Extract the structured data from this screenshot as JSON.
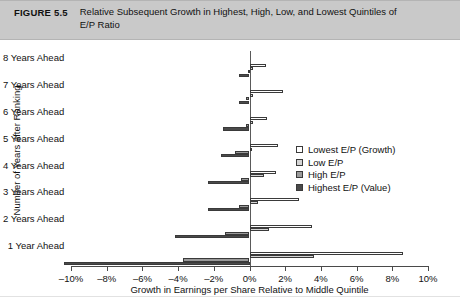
{
  "caption": {
    "figure_number": "FIGURE 5.5",
    "title": "Relative Subsequent Growth in Highest, High, Low, and Lowest Quintiles of E/P Ratio"
  },
  "chart_data": {
    "type": "bar",
    "orientation": "horizontal",
    "title": "Relative Subsequent Growth in Highest, High, Low, and Lowest Quintiles of E/P Ratio",
    "xlabel": "Growth in Earnings per Share Relative to Middle Quintile",
    "ylabel": "Number of Years after Ranking",
    "xlim": [
      -10,
      10
    ],
    "xticks": [
      -10,
      -8,
      -6,
      -4,
      -2,
      0,
      2,
      4,
      6,
      8,
      10
    ],
    "xtick_labels": [
      "–10%",
      "–8%",
      "–6%",
      "–4%",
      "–2%",
      "0%",
      "2%",
      "4%",
      "6%",
      "8%",
      "10%"
    ],
    "grid": false,
    "legend_position": "right",
    "categories": [
      "8 Years Ahead",
      "7 Years Ahead",
      "6 Years Ahead",
      "5 Years Ahead",
      "4 Years Ahead",
      "3 Years Ahead",
      "2 Years Ahead",
      "1 Year Ahead"
    ],
    "series": [
      {
        "name": "Lowest E/P (Growth)",
        "color": "#ffffff",
        "values": [
          0.9,
          1.9,
          1.0,
          1.6,
          1.5,
          2.8,
          3.5,
          8.6
        ]
      },
      {
        "name": "Low E/P",
        "color": "#d5d5d5",
        "values": [
          0.2,
          0.2,
          0.2,
          0.1,
          0.8,
          0.5,
          1.1,
          3.6
        ]
      },
      {
        "name": "High E/P",
        "color": "#9a9a9a",
        "values": [
          -0.1,
          -0.2,
          -0.2,
          -0.8,
          -0.5,
          -0.6,
          -1.4,
          -3.7
        ]
      },
      {
        "name": "Highest E/P (Value)",
        "color": "#4a4a4a",
        "values": [
          -0.6,
          -0.6,
          -1.5,
          -1.6,
          -2.3,
          -2.3,
          -4.2,
          -10.4
        ]
      }
    ]
  }
}
